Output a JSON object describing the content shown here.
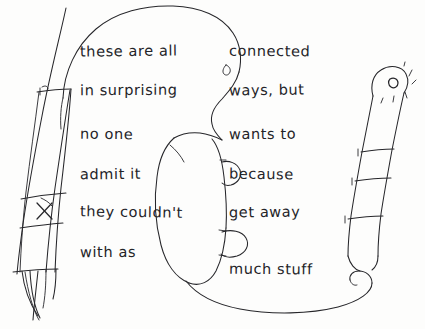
{
  "canvas": {
    "width": 425,
    "height": 329,
    "background_color": "#fdfdfc",
    "ink_color": "#26262a",
    "medium": "pen-on-paper-sketch"
  },
  "handwritten_text": {
    "full_text": "these are all connected in surprising ways, but no one wants to admit it because they couldn't get away with as much stuff",
    "left_column": [
      {
        "id": "l1",
        "text": "these are all"
      },
      {
        "id": "l2",
        "text": "in surprising"
      },
      {
        "id": "l3",
        "text": "no one"
      },
      {
        "id": "l4",
        "text": "admit it"
      },
      {
        "id": "l5",
        "text": "they couldn't"
      },
      {
        "id": "l6",
        "text": "with as"
      }
    ],
    "right_column": [
      {
        "id": "r1",
        "text": "connected"
      },
      {
        "id": "r2",
        "text": "ways, but"
      },
      {
        "id": "r3",
        "text": "wants to"
      },
      {
        "id": "r4",
        "text": "because"
      },
      {
        "id": "r5",
        "text": "get away"
      },
      {
        "id": "r6",
        "text": "much stuff"
      }
    ]
  },
  "drawing": {
    "elements": [
      {
        "name": "large-top-outline",
        "description": "large rounded arching contour across the top, like a palm or thumb pad"
      },
      {
        "name": "left-finger-form",
        "description": "elongated tapering finger-like form at far left with segment bands and an X cross mark"
      },
      {
        "name": "center-blob",
        "description": "rounded oval blob in the middle with two bump notches on its right edge"
      },
      {
        "name": "right-finger-form",
        "description": "elongated finger-like form at right with three segment bands and a small nail loop with radiating ticks at the tip"
      },
      {
        "name": "bottom-sweep-curve",
        "description": "long curve sweeping from the center blob rightward and hooking upward at the right"
      }
    ]
  }
}
